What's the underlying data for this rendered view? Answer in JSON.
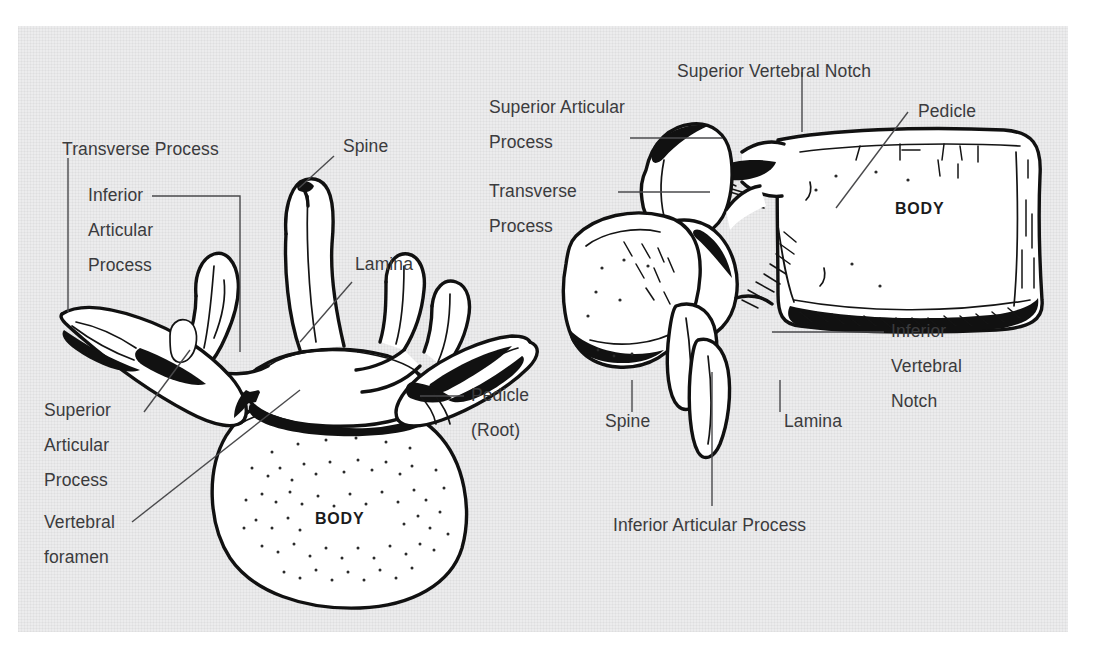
{
  "figure": {
    "panel_background": "#ececed",
    "page_background": "#ffffff",
    "text_color": "#3b3b3d",
    "ink_color": "#111111",
    "leader_color": "#4a4a4c"
  },
  "views": {
    "left": {
      "name": "superior-view",
      "body_tag": "BODY"
    },
    "right": {
      "name": "lateral-view",
      "body_tag": "BODY"
    }
  },
  "labels": {
    "left_transverse_process": "Transverse Process",
    "left_inferior_articular_1": "Inferior",
    "left_inferior_articular_2": "Articular",
    "left_inferior_articular_3": "Process",
    "left_spine": "Spine",
    "left_lamina": "Lamina",
    "left_superior_articular_1": "Superior",
    "left_superior_articular_2": "Articular",
    "left_superior_articular_3": "Process",
    "left_vertebral_foramen_1": "Vertebral",
    "left_vertebral_foramen_2": "foramen",
    "left_pedicle_1": "Pedicle",
    "left_pedicle_2": "(Root)",
    "right_superior_vertebral_notch": "Superior Vertebral Notch",
    "right_superior_articular_1": "Superior Articular",
    "right_superior_articular_2": "Process",
    "right_transverse_1": "Transverse",
    "right_transverse_2": "Process",
    "right_pedicle": "Pedicle",
    "right_inferior_notch_1": "Inferior",
    "right_inferior_notch_2": "Vertebral",
    "right_inferior_notch_3": "Notch",
    "right_spine": "Spine",
    "right_lamina": "Lamina",
    "right_inferior_articular_process": "Inferior Articular Process"
  }
}
